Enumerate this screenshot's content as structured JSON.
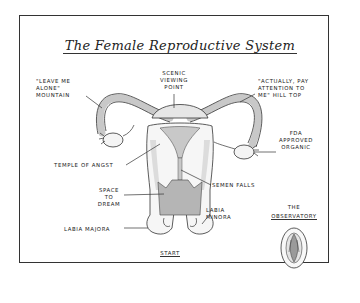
{
  "title": "The Female Reproductive System",
  "labels": {
    "scenic_viewing_point": "Scenic\nViewing\nPoint",
    "leave_me_alone": "\"Leave me\nalone\"\nmountain",
    "actually_pay_attention": "\"Actually, pay\nattention to\nme\" hill top",
    "fda_approved": "FDA\napproved\norganic",
    "temple_of_angst": "Temple of angst",
    "semen_falls": "Semen falls",
    "space_to_dream": "Space\nto\ndream",
    "labia_minora": "Labia\nminora",
    "labia_majora": "Labia majora",
    "start": "Start",
    "the": "The",
    "observatory": "Observatory"
  },
  "colors": {
    "ink": "#222222",
    "shade": "#c8c8c8",
    "shade_dark": "#9a9a9a",
    "paper": "#ffffff"
  }
}
